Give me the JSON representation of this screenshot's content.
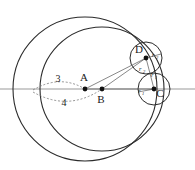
{
  "figure": {
    "background_color": "#ffffff",
    "stroke_color": "#2b2b2b",
    "axis_color": "#999999",
    "dotted_color": "#777777",
    "label_color": "#1a1a1a",
    "width": 195,
    "height": 170
  },
  "points": [
    {
      "id": "A",
      "label": "A",
      "x": 85,
      "y": 89,
      "label_x": 84,
      "label_y": 81
    },
    {
      "id": "B",
      "label": "B",
      "x": 102,
      "y": 89,
      "label_x": 101,
      "label_y": 103
    },
    {
      "id": "C",
      "label": "C",
      "x": 154,
      "y": 89,
      "label_x": 159,
      "label_y": 96
    },
    {
      "id": "D",
      "label": "D",
      "x": 146,
      "y": 58,
      "label_x": 139,
      "label_y": 53
    }
  ],
  "circles": [
    {
      "id": "outer",
      "center_label": "A",
      "cx": 85,
      "cy": 89,
      "r": 72,
      "stroke_width": 1.1
    },
    {
      "id": "inner",
      "center_label": "B",
      "cx": 102,
      "cy": 89,
      "r": 62,
      "stroke_width": 1.1
    },
    {
      "id": "small-c",
      "center_label": "C",
      "cx": 154,
      "cy": 89,
      "r": 16,
      "stroke_width": 1.0
    },
    {
      "id": "small-d",
      "center_label": "D",
      "cx": 146,
      "cy": 58,
      "r": 16,
      "stroke_width": 1.0
    }
  ],
  "axis": {
    "name": "horizontal-axis",
    "x1": 0,
    "y1": 89,
    "x2": 195,
    "y2": 89
  },
  "radius_labels": [
    {
      "id": "r2-upper-right",
      "text": "r",
      "sub": "2",
      "x": 154,
      "y": 56
    },
    {
      "id": "r2-lower-left",
      "text": "r",
      "sub": "2",
      "x": 141,
      "y": 70
    },
    {
      "id": "r1-upper",
      "text": "r",
      "sub": "1",
      "x": 152,
      "y": 76
    },
    {
      "id": "r1-left",
      "text": "r",
      "sub": "1",
      "x": 139,
      "y": 92
    }
  ],
  "measure_labels": [
    {
      "id": "measure-3",
      "text": "3",
      "x": 58,
      "y": 81
    },
    {
      "id": "measure-4",
      "text": "4",
      "x": 64,
      "y": 104
    }
  ],
  "connector_lines": [
    {
      "id": "line-A-to-D",
      "x1": 85,
      "y1": 89,
      "x2": 146,
      "y2": 58
    },
    {
      "id": "line-A-to-C",
      "x1": 85,
      "y1": 89,
      "x2": 154,
      "y2": 89
    },
    {
      "id": "line-B-to-D",
      "x1": 102,
      "y1": 89,
      "x2": 146,
      "y2": 58
    },
    {
      "id": "line-D-to-C",
      "x1": 146,
      "y1": 58,
      "x2": 154,
      "y2": 89
    },
    {
      "id": "radius-D-right",
      "x1": 146,
      "y1": 58,
      "x2": 160,
      "y2": 54
    },
    {
      "id": "radius-C-left",
      "x1": 154,
      "y1": 89,
      "x2": 138,
      "y2": 92
    }
  ],
  "dotted_arcs": [
    {
      "id": "arc-3-upper",
      "path": "M 33 90 Q 60 74 85 89"
    },
    {
      "id": "arc-4-lower",
      "path": "M 33 92 Q 68 112 102 89"
    }
  ]
}
